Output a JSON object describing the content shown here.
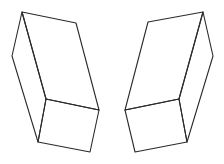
{
  "diagram": {
    "background": "#ffffff",
    "stroke_color": "#2a2a2a",
    "figures": [
      {
        "name": "left-box",
        "vertices": {
          "top_back": [
            22,
            12
          ],
          "top_right": [
            76,
            23
          ],
          "left": [
            12,
            56
          ],
          "inner_corner": [
            46,
            99
          ],
          "right_mid": [
            99,
            110
          ],
          "bottom_left": [
            38,
            142
          ],
          "bottom_right": [
            90,
            152
          ]
        }
      },
      {
        "name": "right-box",
        "vertices": {
          "top_back": [
            203,
            12
          ],
          "top_left": [
            148,
            22
          ],
          "right": [
            213,
            56
          ],
          "inner_corner": [
            179,
            99
          ],
          "left_mid": [
            125,
            110
          ],
          "bottom_right": [
            187,
            142
          ],
          "bottom_left": [
            135,
            152
          ]
        }
      }
    ]
  }
}
